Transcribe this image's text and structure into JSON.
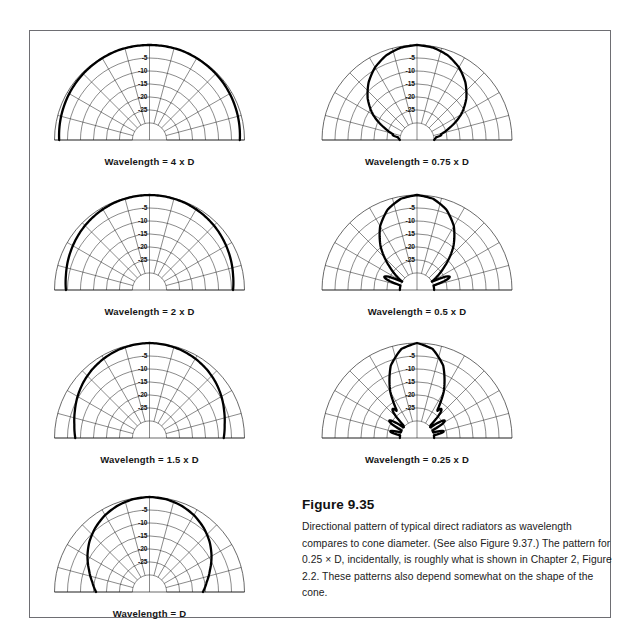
{
  "figure": {
    "number": "Figure 9.35",
    "caption": "Directional pattern of typical direct radiators as wavelength compares to cone diameter. (See also Figure 9.37.) The pattern for 0.25 × D, incidentally, is roughly what is shown in Chapter 2, Figure 2.2. These patterns also depend somewhat on the shape of the cone."
  },
  "chart_data": {
    "type": "line",
    "title": "Directional pattern of typical direct radiators",
    "plot_kind": "polar-half-plane directivity (semicircle, 0° at top)",
    "xlabel": "Angle off axis (degrees, −90° to +90°)",
    "ylabel": "Relative level (dB)",
    "ring_labels": [
      "-5",
      "-10",
      "-15",
      "-20",
      "-25"
    ],
    "ring_values_db": [
      -5,
      -10,
      -15,
      -20,
      -25
    ],
    "radial_axis_range_db": [
      -30,
      0
    ],
    "ring_count": 6,
    "spoke_step_degrees": 15,
    "spoke_angles_degrees": [
      -90,
      -75,
      -60,
      -45,
      -30,
      -15,
      0,
      15,
      30,
      45,
      60,
      75,
      90
    ],
    "grid": true,
    "legend_position": "none",
    "angles_degrees": [
      0,
      10,
      20,
      30,
      40,
      50,
      60,
      70,
      80,
      90
    ],
    "series": [
      {
        "name": "Wavelength = 4 x D",
        "label": "Wavelength = 4 x D",
        "values_db": [
          0,
          0,
          0,
          -0.2,
          -0.4,
          -0.6,
          -0.9,
          -1.2,
          -1.5,
          -1.8
        ]
      },
      {
        "name": "Wavelength = 2 x D",
        "label": "Wavelength = 2 x D",
        "values_db": [
          0,
          -0.1,
          -0.3,
          -0.7,
          -1.2,
          -1.8,
          -2.5,
          -3.2,
          -3.9,
          -4.4
        ]
      },
      {
        "name": "Wavelength = 1.5 x D",
        "label": "Wavelength = 1.5 x D",
        "values_db": [
          0,
          -0.2,
          -0.6,
          -1.3,
          -2.2,
          -3.3,
          -4.6,
          -6.0,
          -7.2,
          -8.0
        ]
      },
      {
        "name": "Wavelength = D",
        "label": "Wavelength = D",
        "values_db": [
          0,
          -0.3,
          -1.1,
          -2.4,
          -4.2,
          -6.4,
          -9.0,
          -11.8,
          -14.2,
          -16.0
        ]
      },
      {
        "name": "Wavelength = 0.75 x D",
        "label": "Wavelength = 0.75 x D",
        "values_db": [
          0,
          -0.5,
          -1.9,
          -4.3,
          -7.6,
          -11.8,
          -17.0,
          -23.5,
          -29.0,
          -30.0
        ],
        "side_lobes": [
          {
            "center_deg": 78,
            "peak_db": -27
          },
          {
            "center_deg": -78,
            "peak_db": -27
          }
        ]
      },
      {
        "name": "Wavelength = 0.5 x D",
        "label": "Wavelength = 0.5 x D",
        "values_db": [
          0,
          -0.9,
          -3.6,
          -8.2,
          -14.8,
          -23.0,
          -30.0,
          -30.0,
          -30.0,
          -30.0
        ],
        "side_lobes": [
          {
            "center_deg": 68,
            "peak_db": -23
          },
          {
            "center_deg": -68,
            "peak_db": -23
          }
        ]
      },
      {
        "name": "Wavelength = 0.25 x D",
        "label": "Wavelength = 0.25 x D",
        "values_db": [
          0,
          -1.8,
          -7.0,
          -16.0,
          -28.0,
          -30.0,
          -30.0,
          -30.0,
          -30.0,
          -30.0
        ],
        "side_lobes": [
          {
            "center_deg": 40,
            "peak_db": -22
          },
          {
            "center_deg": 58,
            "peak_db": -24
          },
          {
            "center_deg": 76,
            "peak_db": -26
          },
          {
            "center_deg": -40,
            "peak_db": -22
          },
          {
            "center_deg": -58,
            "peak_db": -24
          },
          {
            "center_deg": -76,
            "peak_db": -26
          }
        ]
      }
    ]
  },
  "plots": [
    {
      "id": "p-4d",
      "label": "Wavelength = 4 x D"
    },
    {
      "id": "p-2d",
      "label": "Wavelength = 2 x D"
    },
    {
      "id": "p-1_5d",
      "label": "Wavelength = 1.5 x D"
    },
    {
      "id": "p-d",
      "label": "Wavelength = D"
    },
    {
      "id": "p-0_75d",
      "label": "Wavelength = 0.75 x D"
    },
    {
      "id": "p-0_5d",
      "label": "Wavelength = 0.5 x D"
    },
    {
      "id": "p-0_25d",
      "label": "Wavelength = 0.25 x D"
    }
  ],
  "colors": {
    "ink": "#000000",
    "grid": "#2a2a2a",
    "frame": "#6e6e73",
    "background": "#ffffff"
  }
}
